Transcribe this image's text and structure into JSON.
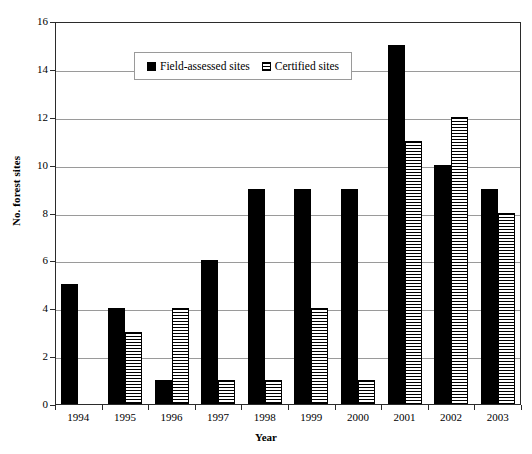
{
  "chart_data": {
    "type": "bar",
    "title": "",
    "subtitle": "",
    "xlabel": "Year",
    "ylabel": "No. forest sites",
    "categories": [
      "1994",
      "1995",
      "1996",
      "1997",
      "1998",
      "1999",
      "2000",
      "2001",
      "2002",
      "2003"
    ],
    "series": [
      {
        "name": "Field-assessed sites",
        "fill": "solid-black",
        "color": "#000000",
        "values": [
          5,
          4,
          1,
          6,
          9,
          9,
          9,
          15,
          10,
          9
        ]
      },
      {
        "name": "Certified sites",
        "fill": "horizontal-hatch",
        "color": "#000000",
        "values": [
          0,
          3,
          4,
          1,
          1,
          4,
          1,
          11,
          12,
          8
        ]
      }
    ],
    "ylim": [
      0,
      16
    ],
    "y_ticks": [
      "0",
      "2",
      "4",
      "6",
      "8",
      "10",
      "12",
      "14",
      "16"
    ],
    "y_tick_values": [
      0,
      2,
      4,
      6,
      8,
      10,
      12,
      14,
      16
    ],
    "grid": "horizontal",
    "legend_position": "top-left-inside",
    "legend_entries": [
      "Field-assessed sites",
      "Certified sites"
    ],
    "axis_color": "#2b2b2b",
    "grid_color": "#9a9a9a",
    "background": "#ffffff"
  }
}
